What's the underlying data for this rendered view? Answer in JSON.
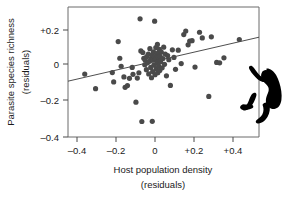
{
  "chart_data": {
    "type": "scatter",
    "title": "",
    "xlabel": "Host population density (residuals)",
    "ylabel": "Parasite species richness (residuals)",
    "xlabel_line1": "Host population density",
    "xlabel_line2": "(residuals)",
    "ylabel_line1": "Parasite species richness",
    "ylabel_line2": "(residuals)",
    "xlim": [
      -0.47,
      0.5
    ],
    "ylim": [
      -0.4,
      0.28
    ],
    "grid": false,
    "legend": null,
    "xticks": [
      -0.4,
      -0.2,
      0,
      0.2,
      0.4
    ],
    "xticklabels": [
      "–0.4",
      "–0.2",
      "0",
      "+0.2",
      "+0.4"
    ],
    "yticks": [
      0.2,
      0,
      -0.2,
      -0.4
    ],
    "yticklabels": [
      "+0.2",
      "0",
      "–0.2",
      "–0.4"
    ],
    "point_color": "#4a4a4a",
    "line_color": "#3a3a3a",
    "frame_color": "#6b6b6b",
    "n_points": 76,
    "trendline": {
      "type": "linear",
      "x_start": -0.47,
      "y_start": -0.108,
      "x_end": 0.5,
      "y_end": 0.122,
      "slope": 0.237,
      "intercept": 0.003
    },
    "points": [
      [
        -0.385,
        -0.071
      ],
      [
        -0.33,
        -0.147
      ],
      [
        -0.245,
        -0.063
      ],
      [
        -0.238,
        -0.112
      ],
      [
        -0.215,
        0.099
      ],
      [
        -0.207,
        0.012
      ],
      [
        -0.2,
        -0.03
      ],
      [
        -0.186,
        -0.086
      ],
      [
        -0.18,
        -0.14
      ],
      [
        -0.168,
        -0.131
      ],
      [
        -0.158,
        -0.093
      ],
      [
        -0.144,
        -0.036
      ],
      [
        -0.14,
        -0.072
      ],
      [
        -0.125,
        -0.218
      ],
      [
        -0.118,
        -0.092
      ],
      [
        -0.11,
        -0.064
      ],
      [
        -0.104,
        0.218
      ],
      [
        -0.1,
        0.05
      ],
      [
        -0.095,
        -0.319
      ],
      [
        -0.09,
        0.042
      ],
      [
        -0.085,
        0.012
      ],
      [
        -0.08,
        -0.022
      ],
      [
        -0.078,
        0.002
      ],
      [
        -0.072,
        -0.048
      ],
      [
        -0.07,
        0.02
      ],
      [
        -0.066,
        -0.012
      ],
      [
        -0.062,
        0.034
      ],
      [
        -0.06,
        -0.07
      ],
      [
        -0.056,
        -0.004
      ],
      [
        -0.054,
        0.062
      ],
      [
        -0.05,
        -0.036
      ],
      [
        -0.048,
        0.01
      ],
      [
        -0.046,
        -0.09
      ],
      [
        -0.044,
        0.028
      ],
      [
        -0.042,
        -0.318
      ],
      [
        -0.04,
        -0.058
      ],
      [
        -0.038,
        0.002
      ],
      [
        -0.036,
        0.046
      ],
      [
        -0.034,
        -0.024
      ],
      [
        -0.032,
        0.018
      ],
      [
        -0.03,
        0.206
      ],
      [
        -0.028,
        -0.074
      ],
      [
        -0.026,
        0.006
      ],
      [
        -0.024,
        0.068
      ],
      [
        -0.022,
        -0.044
      ],
      [
        -0.02,
        0.03
      ],
      [
        -0.018,
        -0.01
      ],
      [
        -0.016,
        0.084
      ],
      [
        -0.014,
        -0.064
      ],
      [
        -0.012,
        0.04
      ],
      [
        -0.01,
        -0.028
      ],
      [
        -0.008,
        0.014
      ],
      [
        -0.006,
        0.058
      ],
      [
        -0.004,
        -0.052
      ],
      [
        -0.002,
        0.022
      ],
      [
        0.0,
        -0.006
      ],
      [
        0.004,
        0.044
      ],
      [
        0.008,
        -0.038
      ],
      [
        0.012,
        0.01
      ],
      [
        0.016,
        0.07
      ],
      [
        0.02,
        -0.02
      ],
      [
        0.024,
        0.034
      ],
      [
        0.03,
        -0.08
      ],
      [
        0.036,
        0.026
      ],
      [
        0.042,
        0.004
      ],
      [
        0.05,
        -0.13
      ],
      [
        0.06,
        0.056
      ],
      [
        0.068,
        0.016
      ],
      [
        0.076,
        -0.046
      ],
      [
        0.09,
        0.054
      ],
      [
        0.105,
        -0.016
      ],
      [
        0.118,
        0.136
      ],
      [
        0.128,
        0.154
      ],
      [
        0.14,
        0.082
      ],
      [
        0.148,
        0.102
      ],
      [
        0.16,
        0.104
      ],
      [
        0.175,
        -0.034
      ],
      [
        0.198,
        0.148
      ],
      [
        0.212,
        0.118
      ],
      [
        0.245,
        -0.188
      ],
      [
        0.258,
        0.124
      ],
      [
        0.285,
        -0.01
      ],
      [
        0.3,
        -0.012
      ],
      [
        0.322,
        0.014
      ],
      [
        0.4,
        0.11
      ]
    ]
  },
  "decoration": {
    "silhouette_name": "climbing-primate-silhouette"
  }
}
